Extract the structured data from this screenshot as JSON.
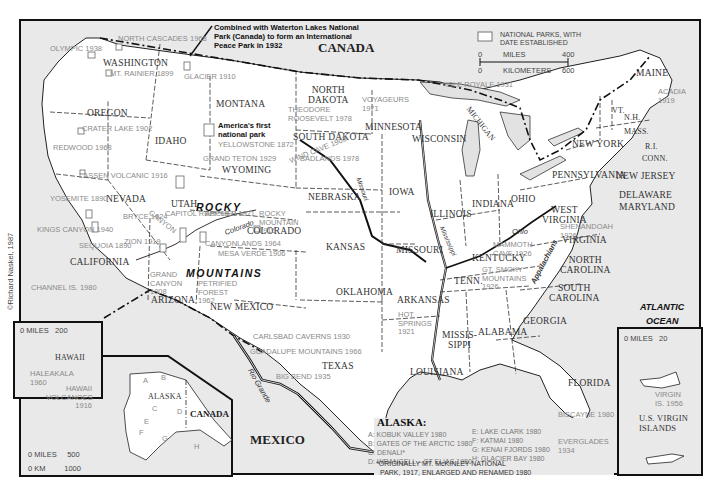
{
  "credit": "©Richard Naskel, 1987",
  "legend": {
    "symbol_label": "NATIONAL PARKS, WITH DATE ESTABLISHED",
    "scale": {
      "miles_label": "MILES",
      "miles_min": "0",
      "miles_max": "400",
      "km_label": "KILOMETERS",
      "km_min": "0",
      "km_max": "600"
    }
  },
  "countries": {
    "canada": "CANADA",
    "mexico": "MEXICO",
    "canada_alaska": "CANADA"
  },
  "oceans": {
    "atlantic_1": "ATLANTIC",
    "atlantic_2": "OCEAN"
  },
  "ranges": {
    "rocky_1": "ROCKY",
    "rocky_2": "MOUNTAINS",
    "appalachians": "Appalachians"
  },
  "rivers": {
    "colorado": "Colorado",
    "missouri": "Missouri",
    "mississippi": "Mississippi",
    "ohio": "Ohio",
    "rio_grande": "Rio Grande"
  },
  "notes": {
    "waterton": "Combined with Waterton Lakes National Park (Canada) to form an International Peace Park in 1932",
    "yellowstone": "America's first national park"
  },
  "states": {
    "washington": "WASHINGTON",
    "oregon": "OREGON",
    "california": "CALIFORNIA",
    "nevada": "NEVADA",
    "idaho": "IDAHO",
    "montana": "MONTANA",
    "wyoming": "WYOMING",
    "utah": "UTAH",
    "colorado": "COLORADO",
    "arizona": "ARIZONA",
    "new_mexico_1": "NEW",
    "new_mexico_2": "MEXICO",
    "north_dakota_1": "NORTH",
    "north_dakota_2": "DAKOTA",
    "south_dakota": "SOUTH DAKOTA",
    "nebraska": "NEBRASKA",
    "kansas": "KANSAS",
    "oklahoma": "OKLAHOMA",
    "texas": "TEXAS",
    "minnesota": "MINNESOTA",
    "iowa": "IOWA",
    "missouri": "MISSOURI",
    "arkansas": "ARKANSAS",
    "louisiana": "LOUISIANA",
    "wisconsin": "WISCONSIN",
    "illinois": "ILLINOIS",
    "michigan": "MICHIGAN",
    "indiana": "INDIANA",
    "ohio": "OHIO",
    "kentucky": "KENTUCKY",
    "tennessee": "TENN.",
    "mississippi_1": "MISSIS-",
    "mississippi_2": "SIPPI",
    "alabama": "ALABAMA",
    "georgia": "GEORGIA",
    "florida": "FLORIDA",
    "south_carolina_1": "SOUTH",
    "south_carolina_2": "CAROLINA",
    "north_carolina_1": "NORTH",
    "north_carolina_2": "CAROLINA",
    "virginia": "VIRGINIA",
    "west_virginia_1": "WEST",
    "west_virginia_2": "VIRGINIA",
    "pennsylvania": "PENNSYLVANIA",
    "new_york": "NEW YORK",
    "new_jersey": "NEW JERSEY",
    "delaware": "DELAWARE",
    "maryland": "MARYLAND",
    "maine": "MAINE",
    "vermont": "VT.",
    "new_hampshire": "N.H.",
    "massachusetts": "MASS.",
    "rhode_island": "R.I.",
    "connecticut": "CONN.",
    "hawaii": "HAWAII",
    "alaska": "ALASKA"
  },
  "parks": [
    {
      "name": "OLYMPIC",
      "year": "1938"
    },
    {
      "name": "NORTH CASCADES",
      "year": "1968"
    },
    {
      "name": "MT. RAINIER",
      "year": "1899"
    },
    {
      "name": "GLACIER",
      "year": "1910"
    },
    {
      "name": "CRATER LAKE",
      "year": "1902"
    },
    {
      "name": "REDWOOD",
      "year": "1968"
    },
    {
      "name": "LASSEN VOLCANIC",
      "year": "1916"
    },
    {
      "name": "YOSEMITE",
      "year": "1890"
    },
    {
      "name": "KINGS CANYON",
      "year": "1940"
    },
    {
      "name": "SEQUOIA",
      "year": "1890"
    },
    {
      "name": "CHANNEL IS.",
      "year": "1980"
    },
    {
      "name": "YELLOWSTONE",
      "year": "1872"
    },
    {
      "name": "GRAND TETON",
      "year": "1929"
    },
    {
      "name": "BRYCE CANYON",
      "year": "1924"
    },
    {
      "name": "ZION",
      "year": "1919"
    },
    {
      "name": "CAPITOL REEF",
      "year": "1971"
    },
    {
      "name": "ARCHES",
      "year": "1971"
    },
    {
      "name": "CANYONLANDS",
      "year": "1964"
    },
    {
      "name": "MESA VERDE",
      "year": "1906"
    },
    {
      "name": "ROCKY MOUNTAIN",
      "year": "1915"
    },
    {
      "name": "GRAND CANYON",
      "year": "1908"
    },
    {
      "name": "PETRIFIED FOREST",
      "year": "1962"
    },
    {
      "name": "CARLSBAD CAVERNS",
      "year": "1930"
    },
    {
      "name": "GUADALUPE MOUNTAINS",
      "year": "1966"
    },
    {
      "name": "BIG BEND",
      "year": "1935"
    },
    {
      "name": "THEODORE ROOSEVELT",
      "year": "1978"
    },
    {
      "name": "WIND CAVE",
      "year": "1903"
    },
    {
      "name": "BADLANDS",
      "year": "1978"
    },
    {
      "name": "VOYAGEURS",
      "year": "1971"
    },
    {
      "name": "ISLE ROYALE",
      "year": "1931"
    },
    {
      "name": "HOT SPRINGS",
      "year": "1921"
    },
    {
      "name": "MAMMOTH CAVE",
      "year": "1926"
    },
    {
      "name": "GT. SMOKY MOUNTAINS",
      "year": "1926"
    },
    {
      "name": "SHENANDOAH",
      "year": "1926"
    },
    {
      "name": "ACADIA",
      "year": "1919"
    },
    {
      "name": "BISCAYNE",
      "year": "1980"
    },
    {
      "name": "EVERGLADES",
      "year": "1934"
    },
    {
      "name": "HALEAKALA",
      "year": "1960"
    },
    {
      "name": "HAWAII VOLCANOES",
      "year": "1916"
    },
    {
      "name": "VIRGIN IS.",
      "year": "1956"
    }
  ],
  "labels": {
    "olympic": "OLYMPIC 1938",
    "north_cascades": "NORTH CASCADES 1968",
    "mt_rainier": "MT. RAINIER 1899",
    "glacier": "GLACIER 1910",
    "crater_lake": "CRATER LAKE 1902",
    "redwood": "REDWOOD 1968",
    "lassen": "LASSEN VOLCANIC 1916",
    "yosemite": "YOSEMITE 1890",
    "kings_canyon": "KINGS CANYON 1940",
    "sequoia": "SEQUOIA 1890",
    "channel_is": "CHANNEL IS. 1980",
    "yellowstone": "YELLOWSTONE 1872",
    "grand_teton": "GRAND TETON 1929",
    "bryce": "BRYCE 1924",
    "canyon_word": "CANYON",
    "zion": "ZION 1919",
    "capitol_reef": "CAPITOL REEF 1971",
    "arches": "ARCHES 1971",
    "canyonlands": "CANYONLANDS 1964",
    "mesa_verde": "MESA VERDE 1906",
    "rocky_mountain": "ROCKY MOUNTAIN 1915",
    "grand_canyon": "GRAND CANYON 1908",
    "petrified_forest": "PETRIFIED FOREST 1962",
    "carlsbad": "CARLSBAD CAVERNS 1930",
    "guadalupe": "GUADALUPE MOUNTAINS 1966",
    "big_bend": "BIG BEND 1935",
    "theodore_roosevelt": "THEODORE ROOSEVELT 1978",
    "wind_cave": "WIND CAVE 1903",
    "badlands": "BADLANDS 1978",
    "voyageurs": "VOYAGEURS 1971",
    "isle_royale": "ISLE ROYALE 1931",
    "hot_springs": "HOT SPRINGS 1921",
    "mammoth_cave": "MAMMOTH CAVE 1926",
    "smoky": "GT. SMOKY MOUNTAINS 1926",
    "shenandoah": "SHENANDOAH 1926",
    "acadia": "ACADIA 1919",
    "biscayne": "BISCAYNE 1980",
    "everglades": "EVERGLADES 1934",
    "haleakala": "HALEAKALA 1960",
    "hawaii_volcanoes": "HAWAII VOLCANOES 1916",
    "virgin_is": "VIRGIN IS. 1956"
  },
  "hawaii_inset": {
    "miles_label": "MILES",
    "miles_min": "0",
    "miles_max": "200"
  },
  "alaska_inset": {
    "miles_label": "MILES",
    "miles_min": "0",
    "miles_max": "500",
    "km_label": "KM",
    "km_min": "0",
    "km_max": "1000",
    "letters": [
      "A",
      "B",
      "C",
      "D",
      "E",
      "F",
      "G",
      "H"
    ]
  },
  "virgin_islands_inset": {
    "miles_label": "MILES",
    "miles_min": "0",
    "miles_max": "20",
    "title_1": "U.S. VIRGIN",
    "title_2": "ISLANDS"
  },
  "alaska_key": {
    "title": "ALASKA:",
    "left": [
      "A: KOBUK VALLEY 1980",
      "B: GATES OF THE ARCTIC 1980",
      "C: DENALI*",
      "D: WRANGELL – ST ELIAS 1980"
    ],
    "right": [
      "E: LAKE CLARK 1980",
      "F: KATMAI 1980",
      "G: KENAI FJORDS 1980",
      "H: GLACIER BAY 1980"
    ],
    "footnote_1": "*ORIGINALLY MT. McKINLEY NATIONAL",
    "footnote_2": "PARK, 1917, ENLARGED AND RENAMED 1980"
  }
}
